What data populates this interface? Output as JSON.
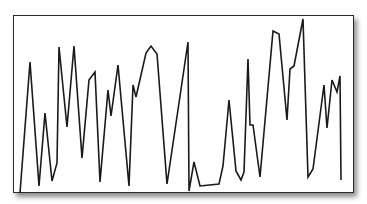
{
  "chart_data": {
    "type": "line",
    "title": "",
    "xlabel": "",
    "ylabel": "",
    "grid": false,
    "legend": null,
    "ylim": [
      0,
      100
    ],
    "line_color": "#1a1a1a",
    "frame_color": "#2b2b2b",
    "x": [
      0,
      1,
      2,
      3,
      4,
      5,
      6,
      7,
      8,
      9,
      10,
      11,
      12,
      13,
      14,
      15,
      16,
      17,
      18,
      19,
      20,
      21,
      22,
      23,
      24,
      25,
      26,
      27,
      28,
      29,
      30,
      31,
      32,
      33,
      34,
      35,
      36,
      37,
      38,
      39,
      40,
      41,
      42,
      43,
      44,
      45,
      46,
      47,
      48,
      49,
      50
    ],
    "values": [
      -1,
      73,
      3,
      44,
      6,
      16,
      82,
      36,
      82,
      19,
      63,
      67,
      5,
      57,
      43,
      72,
      3,
      60,
      53,
      78,
      82,
      78,
      4,
      85,
      0,
      17,
      3,
      4,
      14,
      52,
      11,
      6,
      11,
      75,
      38,
      38,
      8,
      91,
      89,
      40,
      69,
      71,
      98,
      8,
      12,
      60,
      36,
      63,
      56,
      65,
      6
    ],
    "points_px": [
      [
        20,
        193
      ],
      [
        30,
        62
      ],
      [
        39,
        186
      ],
      [
        45,
        113
      ],
      [
        52,
        181
      ],
      [
        57,
        163
      ],
      [
        59,
        47
      ],
      [
        67,
        127
      ],
      [
        74,
        46
      ],
      [
        82,
        158
      ],
      [
        89,
        80
      ],
      [
        95,
        72
      ],
      [
        100,
        182
      ],
      [
        108,
        90
      ],
      [
        111,
        116
      ],
      [
        118,
        65
      ],
      [
        129,
        186
      ],
      [
        133,
        85
      ],
      [
        136,
        97
      ],
      [
        146,
        53
      ],
      [
        151,
        46
      ],
      [
        157,
        54
      ],
      [
        167,
        184
      ],
      [
        188,
        42
      ],
      [
        189,
        191
      ],
      [
        194,
        162
      ],
      [
        200,
        186
      ],
      [
        219,
        184
      ],
      [
        223,
        166
      ],
      [
        229,
        100
      ],
      [
        236,
        171
      ],
      [
        241,
        180
      ],
      [
        244,
        172
      ],
      [
        248,
        59
      ],
      [
        250,
        125
      ],
      [
        253,
        125
      ],
      [
        260,
        177
      ],
      [
        273,
        31
      ],
      [
        279,
        34
      ],
      [
        287,
        120
      ],
      [
        290,
        69
      ],
      [
        294,
        66
      ],
      [
        303,
        19
      ],
      [
        308,
        177
      ],
      [
        313,
        169
      ],
      [
        324,
        85
      ],
      [
        327,
        128
      ],
      [
        332,
        80
      ],
      [
        337,
        92
      ],
      [
        340,
        76
      ],
      [
        341,
        180
      ]
    ]
  }
}
